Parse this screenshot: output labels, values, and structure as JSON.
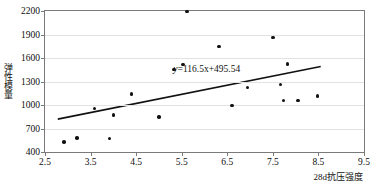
{
  "chart_data": {
    "type": "scatter",
    "title": "",
    "xlabel": "28d抗压强度",
    "ylabel": "弹性模量",
    "xlim": [
      2.5,
      9.5
    ],
    "ylim": [
      400,
      2200
    ],
    "xticks": [
      "2.5",
      "3.5",
      "4.5",
      "5.5",
      "6.5",
      "7.5",
      "8.5",
      "9.5"
    ],
    "yticks": [
      "400",
      "700",
      "1000",
      "1300",
      "1600",
      "1900",
      "2200"
    ],
    "grid": "horizontal",
    "legend": "none",
    "series": [
      {
        "name": "samples",
        "marker": "filled-circle",
        "color": "#111111",
        "points": [
          {
            "x": 2.92,
            "y": 530
          },
          {
            "x": 3.2,
            "y": 580
          },
          {
            "x": 3.58,
            "y": 955
          },
          {
            "x": 3.92,
            "y": 570
          },
          {
            "x": 4.0,
            "y": 870
          },
          {
            "x": 4.4,
            "y": 1140
          },
          {
            "x": 5.0,
            "y": 845
          },
          {
            "x": 5.33,
            "y": 1455
          },
          {
            "x": 5.53,
            "y": 1520
          },
          {
            "x": 5.62,
            "y": 2195
          },
          {
            "x": 6.32,
            "y": 1745
          },
          {
            "x": 6.6,
            "y": 995
          },
          {
            "x": 6.95,
            "y": 1225
          },
          {
            "x": 7.5,
            "y": 1865
          },
          {
            "x": 7.67,
            "y": 1260
          },
          {
            "x": 7.73,
            "y": 1060
          },
          {
            "x": 7.82,
            "y": 1525
          },
          {
            "x": 8.05,
            "y": 1060
          },
          {
            "x": 8.48,
            "y": 1115
          }
        ]
      }
    ],
    "trendline": {
      "equation": "y=116.5x+495.54",
      "equation_parts": {
        "lhs": "y",
        "rhs": "=116.5x+495.54"
      },
      "slope": 116.5,
      "intercept": 495.54,
      "x_start": 2.78,
      "x_end": 8.55,
      "color": "#111111"
    },
    "annotations": [
      {
        "name": "regression-equation",
        "text": "y=116.5x+495.54",
        "x": 6.05,
        "y": 1460
      }
    ]
  }
}
